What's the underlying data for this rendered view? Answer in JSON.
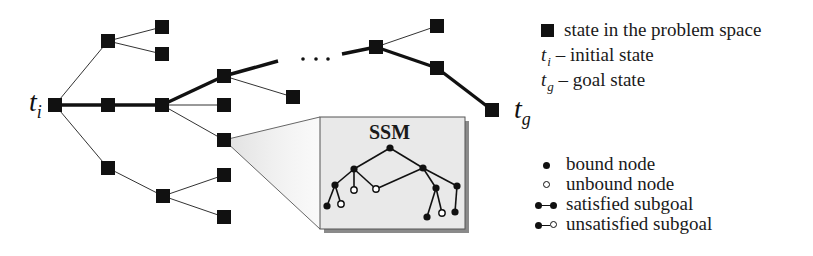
{
  "diagram": {
    "labels": {
      "initial": {
        "t": "t",
        "sub": "i"
      },
      "goal": {
        "t": "t",
        "sub": "g"
      },
      "ellipsis": "· · ·",
      "ssm_title": "SSM"
    },
    "colors": {
      "node": "#111111",
      "edge": "#333333",
      "ssm_fill": "#e9e9e9",
      "ssm_shadow": "#8a8a8a",
      "ssm_border": "#555555"
    },
    "state_nodes": [
      {
        "id": "ti",
        "x": 55,
        "y": 105
      },
      {
        "id": "a1",
        "x": 108,
        "y": 41
      },
      {
        "id": "a2",
        "x": 108,
        "y": 105
      },
      {
        "id": "a3",
        "x": 108,
        "y": 168
      },
      {
        "id": "b1",
        "x": 162,
        "y": 27
      },
      {
        "id": "b2",
        "x": 162,
        "y": 54
      },
      {
        "id": "b3",
        "x": 162,
        "y": 105
      },
      {
        "id": "b4",
        "x": 163,
        "y": 196
      },
      {
        "id": "c1",
        "x": 224,
        "y": 76
      },
      {
        "id": "c2",
        "x": 224,
        "y": 105
      },
      {
        "id": "c3",
        "x": 224,
        "y": 140
      },
      {
        "id": "c4",
        "x": 224,
        "y": 175
      },
      {
        "id": "c5",
        "x": 224,
        "y": 217
      },
      {
        "id": "d1",
        "x": 293,
        "y": 97
      },
      {
        "id": "e1",
        "x": 376,
        "y": 47
      },
      {
        "id": "f1",
        "x": 437,
        "y": 26
      },
      {
        "id": "f2",
        "x": 437,
        "y": 68
      },
      {
        "id": "tg",
        "x": 492,
        "y": 110
      }
    ],
    "edges": [
      {
        "from": "ti",
        "to": "a1",
        "bold": false
      },
      {
        "from": "ti",
        "to": "a2",
        "bold": true
      },
      {
        "from": "ti",
        "to": "a3",
        "bold": false
      },
      {
        "from": "a1",
        "to": "b1",
        "bold": false
      },
      {
        "from": "a1",
        "to": "b2",
        "bold": false
      },
      {
        "from": "a2",
        "to": "b3",
        "bold": true
      },
      {
        "from": "a3",
        "to": "b4",
        "bold": false
      },
      {
        "from": "b3",
        "to": "c1",
        "bold": true
      },
      {
        "from": "b3",
        "to": "c2",
        "bold": false
      },
      {
        "from": "b3",
        "to": "c3",
        "bold": false
      },
      {
        "from": "b4",
        "to": "c4",
        "bold": false
      },
      {
        "from": "b4",
        "to": "c5",
        "bold": false
      },
      {
        "from": "c1",
        "to": "d1",
        "bold": false
      },
      {
        "from": "e1",
        "to": "f1",
        "bold": false
      },
      {
        "from": "e1",
        "to": "f2",
        "bold": true
      },
      {
        "from": "f2",
        "to": "tg",
        "bold": true
      }
    ],
    "partial_edges": [
      {
        "x1": 224,
        "y1": 76,
        "x2": 278,
        "y2": 61,
        "bold": true
      },
      {
        "x1": 342,
        "y1": 54,
        "x2": 376,
        "y2": 47,
        "bold": true
      }
    ],
    "ssm_box": {
      "x": 320,
      "y": 117,
      "w": 145,
      "h": 112,
      "expands_node": "c3"
    },
    "ssm_nodes": [
      {
        "id": "r",
        "x": 390,
        "y": 148,
        "bound": true
      },
      {
        "id": "l1",
        "x": 354,
        "y": 169,
        "bound": true
      },
      {
        "id": "l2",
        "x": 335,
        "y": 185,
        "bound": true
      },
      {
        "id": "l2a",
        "x": 327,
        "y": 206,
        "bound": true
      },
      {
        "id": "l2b",
        "x": 341,
        "y": 204,
        "bound": false
      },
      {
        "id": "l1b",
        "x": 354,
        "y": 190,
        "bound": false
      },
      {
        "id": "m",
        "x": 376,
        "y": 189,
        "bound": false
      },
      {
        "id": "r1",
        "x": 423,
        "y": 168,
        "bound": true
      },
      {
        "id": "r2",
        "x": 436,
        "y": 188,
        "bound": true
      },
      {
        "id": "r3",
        "x": 457,
        "y": 186,
        "bound": true
      },
      {
        "id": "r2a",
        "x": 427,
        "y": 217,
        "bound": true
      },
      {
        "id": "r2b",
        "x": 442,
        "y": 213,
        "bound": false
      },
      {
        "id": "r3a",
        "x": 455,
        "y": 212,
        "bound": true
      }
    ],
    "ssm_edges": [
      [
        "r",
        "l1"
      ],
      [
        "r",
        "r1"
      ],
      [
        "l1",
        "l2"
      ],
      [
        "l1",
        "l1b"
      ],
      [
        "l1",
        "m"
      ],
      [
        "l2",
        "l2a"
      ],
      [
        "l2",
        "l2b"
      ],
      [
        "r1",
        "m"
      ],
      [
        "r1",
        "r2"
      ],
      [
        "r1",
        "r3"
      ],
      [
        "r2",
        "r2a"
      ],
      [
        "r2",
        "r2b"
      ],
      [
        "r3",
        "r3a"
      ]
    ]
  },
  "legend_top": {
    "items": [
      {
        "symbol": "square",
        "text": "state in the problem space"
      },
      {
        "symbol_t": "t",
        "symbol_sub": "i",
        "text": " – initial state"
      },
      {
        "symbol_t": "t",
        "symbol_sub": "g",
        "text": " – goal state"
      }
    ]
  },
  "legend_bottom": {
    "items": [
      {
        "symbol": "filled-dot",
        "text": "bound node"
      },
      {
        "symbol": "open-dot",
        "text": "unbound node"
      },
      {
        "symbol": "filled-filled",
        "text": "satisfied subgoal"
      },
      {
        "symbol": "filled-open",
        "text": "unsatisfied subgoal"
      }
    ]
  }
}
